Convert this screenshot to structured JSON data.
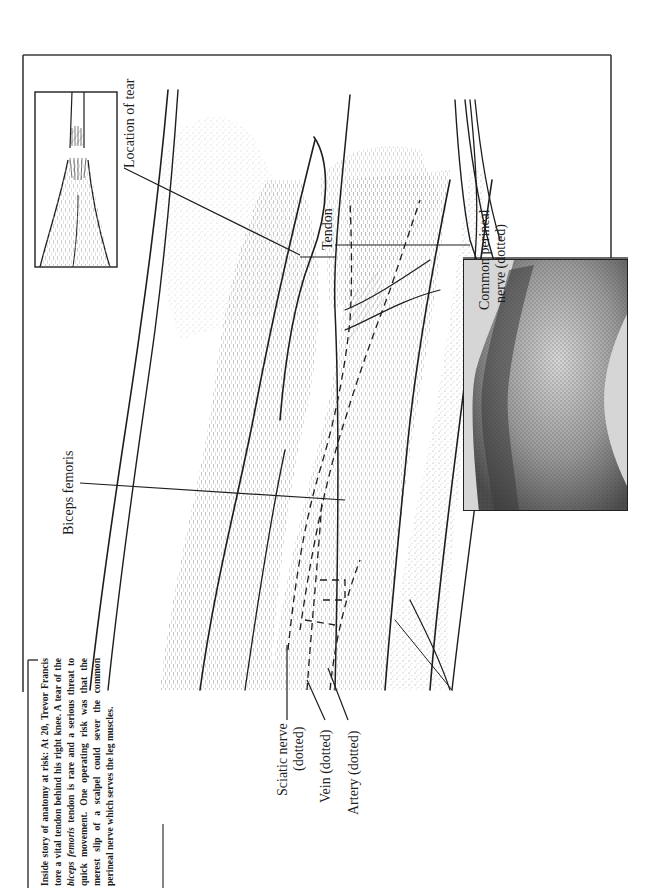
{
  "caption": {
    "lead": "Inside story of anatomy at risk: At 20, Trevor Francis tore a vital tendon behind his right knee. A tear of the",
    "italic_term": "biceps femoris",
    "tail": "tendon is rare and a serious threat to quick movement. One operating risk was that the merest slip of a scalpel could sever the common perineal nerve which serves the leg muscles."
  },
  "labels": {
    "location_of_tear": "Location of tear",
    "tendon": "Tendon",
    "biceps_femoris": "Biceps femoris",
    "common_perineal_line1": "Common perineal",
    "common_perineal_line2": "nerve (dotted)",
    "sciatic_line1": "Sciatic nerve",
    "sciatic_line2": "(dotted)",
    "vein": "Vein (dotted)",
    "artery": "Artery (dotted)"
  },
  "figures": {
    "main_illustration": "anatomical drawing of knee with biceps femoris tendon",
    "inset": "close-up of torn tendon",
    "photo": "photograph of back of knee"
  },
  "colors": {
    "ink": "#1e1e1e",
    "stipple": "#9a9a9a",
    "paper": "#ffffff"
  }
}
